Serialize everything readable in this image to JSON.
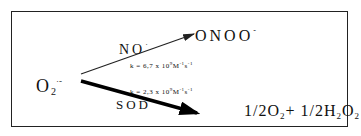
{
  "diagram": {
    "type": "reaction-scheme",
    "reactant": {
      "base": "O",
      "subscript": "2",
      "superscript": "·-"
    },
    "pathways": [
      {
        "id": "nitric-oxide",
        "catalyst": {
          "base": "NO",
          "superscript": "·"
        },
        "rate": {
          "prefix": "k = 6,7 x 10",
          "exponent": "9",
          "unit": "M",
          "unit_exp1": "-1",
          "unit2": "s",
          "unit_exp2": "-1"
        },
        "product": {
          "base": "ONOO",
          "superscript": "-"
        },
        "arrow": {
          "weight": "thin",
          "color": "#222222"
        }
      },
      {
        "id": "superoxide-dismutase",
        "catalyst": {
          "base": "SOD"
        },
        "rate": {
          "prefix": "k = 2,3 x 10",
          "exponent": "9",
          "unit": "M",
          "unit_exp1": "-1",
          "unit2": "s",
          "unit_exp2": "-1"
        },
        "product": {
          "t1": "1/2O",
          "s1": "2",
          "t2": "+ 1/2H",
          "s2": "2",
          "t3": "O",
          "s3": "2"
        },
        "arrow": {
          "weight": "thick",
          "color": "#000000"
        }
      }
    ]
  }
}
